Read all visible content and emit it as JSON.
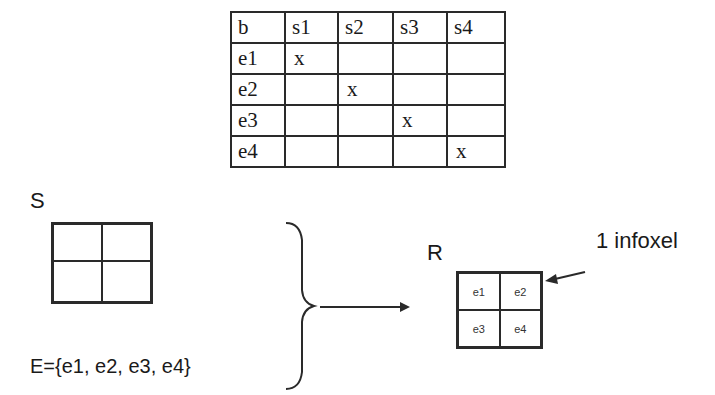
{
  "table": {
    "headers": [
      "b",
      "s1",
      "s2",
      "s3",
      "s4"
    ],
    "rows": [
      [
        "e1",
        "x",
        "",
        "",
        ""
      ],
      [
        "e2",
        "",
        "x",
        "",
        ""
      ],
      [
        "e3",
        "",
        "",
        "x",
        ""
      ],
      [
        "e4",
        "",
        "",
        "",
        "x"
      ]
    ]
  },
  "labels": {
    "s": "S",
    "r": "R",
    "e_set": "E={e1, e2, e3, e4}",
    "infoxel": "1 infoxel"
  },
  "s_grid": {
    "cells": [
      "",
      "",
      "",
      ""
    ]
  },
  "r_grid": {
    "cells": [
      "e1",
      "e2",
      "e3",
      "e4"
    ]
  },
  "colors": {
    "stroke": "#2a2a2a",
    "text": "#1a1a1a",
    "background": "#ffffff"
  }
}
